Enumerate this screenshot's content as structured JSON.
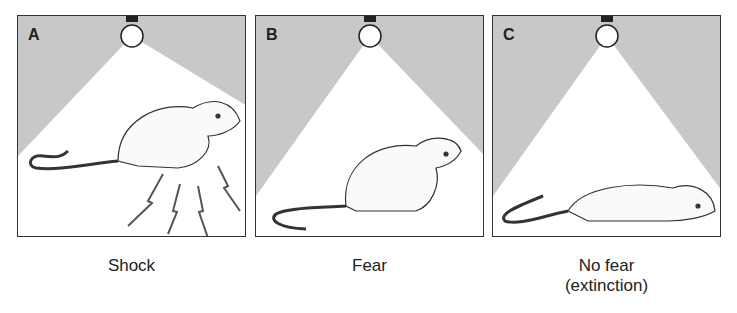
{
  "figure": {
    "panels": [
      {
        "letter": "A",
        "caption_line1": "Shock",
        "caption_line2": ""
      },
      {
        "letter": "B",
        "caption_line1": "Fear",
        "caption_line2": ""
      },
      {
        "letter": "C",
        "caption_line1": "No fear",
        "caption_line2": "(extinction)"
      }
    ],
    "colors": {
      "background_gray": "#c8c8c8",
      "light_cone": "#ffffff",
      "border": "#333333"
    }
  }
}
